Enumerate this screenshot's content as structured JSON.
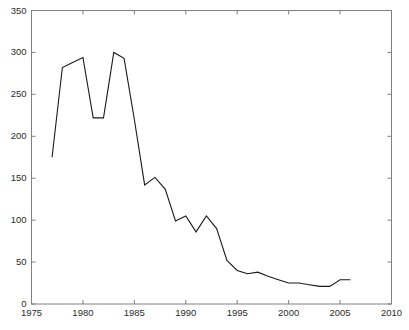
{
  "figure": {
    "background_color": "#ffffff",
    "axis_color": "#808080",
    "line_color": "#1a1a1a",
    "tick_text_color": "#2b2b2b"
  },
  "chart_data": {
    "type": "line",
    "title": "",
    "xlabel": "",
    "ylabel": "",
    "xlim": [
      1975,
      2010
    ],
    "ylim": [
      0,
      350
    ],
    "xticks": [
      1975,
      1980,
      1985,
      1990,
      1995,
      2000,
      2005,
      2010
    ],
    "xtick_labels": [
      "1975",
      "1980",
      "1985",
      "1990",
      "1995",
      "2000",
      "2005",
      "2010"
    ],
    "yticks": [
      0,
      50,
      100,
      150,
      200,
      250,
      300,
      350
    ],
    "ytick_labels": [
      "0",
      "50",
      "100",
      "150",
      "200",
      "250",
      "300",
      "350"
    ],
    "grid": false,
    "legend": null,
    "series": [
      {
        "name": "series-1",
        "color": "#1a1a1a",
        "x": [
          1977,
          1978,
          1979,
          1980,
          1981,
          1982,
          1983,
          1984,
          1985,
          1986,
          1987,
          1988,
          1989,
          1990,
          1991,
          1992,
          1993,
          1994,
          1995,
          1996,
          1997,
          1998,
          1999,
          2000,
          2001,
          2002,
          2003,
          2004,
          2005,
          2006
        ],
        "values": [
          175,
          282,
          288,
          294,
          222,
          222,
          300,
          293,
          220,
          142,
          151,
          137,
          99,
          105,
          86,
          105,
          90,
          52,
          40,
          36,
          38,
          33,
          29,
          25,
          25,
          23,
          21,
          21,
          29,
          29
        ]
      }
    ]
  }
}
